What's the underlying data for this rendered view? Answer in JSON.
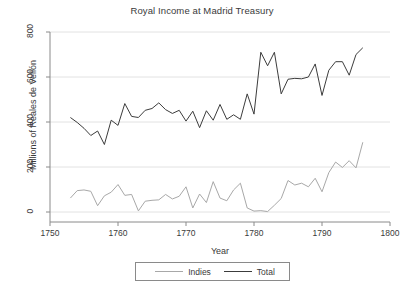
{
  "chart_data": {
    "type": "line",
    "title": "Royal Income at Madrid Treasury",
    "xlabel": "Year",
    "ylabel": "Millions of Reales de Vellón",
    "xlim": [
      1750,
      1800
    ],
    "ylim": [
      0,
      800
    ],
    "xticks": [
      1750,
      1760,
      1770,
      1780,
      1790,
      1800
    ],
    "yticks": [
      0,
      200,
      400,
      600,
      800
    ],
    "grid": true,
    "legend_position": "bottom-center",
    "colors": {
      "indies": "#a8a8a8",
      "total": "#3c3c3c",
      "grid": "#e2e2e2",
      "axis": "#8a8a8a"
    },
    "x": [
      1753,
      1754,
      1755,
      1756,
      1757,
      1758,
      1759,
      1760,
      1761,
      1762,
      1763,
      1764,
      1765,
      1766,
      1767,
      1768,
      1769,
      1770,
      1771,
      1772,
      1773,
      1774,
      1775,
      1776,
      1777,
      1778,
      1779,
      1780,
      1781,
      1782,
      1783,
      1784,
      1785,
      1786,
      1787,
      1788,
      1789,
      1790,
      1791,
      1792,
      1793,
      1794,
      1795,
      1796
    ],
    "series": [
      {
        "name": "Indies",
        "values": [
          62,
          95,
          98,
          92,
          28,
          72,
          88,
          122,
          74,
          78,
          5,
          48,
          52,
          54,
          78,
          58,
          70,
          112,
          18,
          80,
          42,
          135,
          62,
          50,
          98,
          128,
          18,
          4,
          6,
          2,
          30,
          60,
          140,
          120,
          128,
          112,
          150,
          90,
          175,
          222,
          198,
          228,
          196,
          310
        ]
      },
      {
        "name": "Total",
        "values": [
          420,
          398,
          372,
          340,
          360,
          300,
          408,
          385,
          482,
          425,
          420,
          452,
          460,
          485,
          455,
          438,
          452,
          404,
          448,
          375,
          450,
          408,
          478,
          412,
          432,
          412,
          525,
          435,
          710,
          650,
          710,
          525,
          590,
          594,
          592,
          600,
          658,
          518,
          630,
          668,
          668,
          608,
          700,
          730
        ]
      }
    ]
  },
  "legend": {
    "entries": [
      {
        "label": "Indies"
      },
      {
        "label": "Total"
      }
    ]
  },
  "axes": {
    "x_tick_labels": [
      "1750",
      "1760",
      "1770",
      "1780",
      "1790",
      "1800"
    ],
    "y_tick_labels": [
      "0",
      "200",
      "400",
      "600",
      "800"
    ]
  }
}
